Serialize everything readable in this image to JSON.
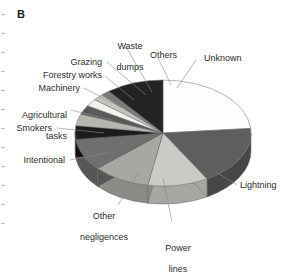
{
  "figure": {
    "panel_label": "B",
    "background": "#ffffff"
  },
  "chart_data": {
    "type": "pie",
    "title": "B",
    "subtitle": "",
    "xlabel": "",
    "ylabel": "",
    "style": "3d-pie",
    "legend_position": "none",
    "labels_position": "callout-leader-lines",
    "grid": false,
    "start_angle_deg": 0,
    "direction": "clockwise",
    "categories": [
      "Unknown",
      "Lightning",
      "Power lines",
      "Other negligences",
      "Intentional",
      "Smokers",
      "Agricultural tasks",
      "Machinery",
      "Forestry works",
      "Grazing",
      "Waste dumps",
      "Others"
    ],
    "values": [
      23.6,
      18.1,
      11.1,
      10.6,
      9.7,
      4.2,
      3.6,
      2.8,
      2.2,
      1.9,
      1.7,
      10.5
    ],
    "units": "percent",
    "slices": [
      {
        "label": "Unknown",
        "value": 23.6,
        "start_deg": 0.0,
        "end_deg": 85.0,
        "color": "#fdfdfb",
        "side_color": "#d9d9d4",
        "label_pos": "right-top"
      },
      {
        "label": "Lightning",
        "value": 18.1,
        "start_deg": 85.0,
        "end_deg": 150.0,
        "color": "#5e5e5e",
        "side_color": "#464646",
        "label_pos": "right-bottom"
      },
      {
        "label": "Power lines",
        "value": 11.1,
        "start_deg": 150.0,
        "end_deg": 190.0,
        "color": "#cbcbc6",
        "side_color": "#a7a7a2",
        "label_pos": "bottom-center"
      },
      {
        "label": "Other negligences",
        "value": 10.6,
        "start_deg": 190.0,
        "end_deg": 228.0,
        "color": "#a8a8a3",
        "side_color": "#8a8a86",
        "label_pos": "bottom-left"
      },
      {
        "label": "Intentional",
        "value": 9.7,
        "start_deg": 228.0,
        "end_deg": 263.0,
        "color": "#6f6f6f",
        "side_color": "#565656",
        "label_pos": "left"
      },
      {
        "label": "Smokers",
        "value": 4.2,
        "start_deg": 263.0,
        "end_deg": 278.0,
        "color": "#1c1c1c",
        "side_color": "#0f0f0f",
        "label_pos": "left"
      },
      {
        "label": "Agricultural tasks",
        "value": 3.6,
        "start_deg": 278.0,
        "end_deg": 291.0,
        "color": "#b6b6b1",
        "side_color": "#949490",
        "label_pos": "left"
      },
      {
        "label": "Machinery",
        "value": 2.8,
        "start_deg": 291.0,
        "end_deg": 301.0,
        "color": "#5a5a5a",
        "side_color": "#444444",
        "label_pos": "left"
      },
      {
        "label": "Forestry works",
        "value": 2.2,
        "start_deg": 301.0,
        "end_deg": 309.0,
        "color": "#f2f2ee",
        "side_color": "#cfcfca",
        "label_pos": "left"
      },
      {
        "label": "Grazing",
        "value": 1.9,
        "start_deg": 309.0,
        "end_deg": 316.0,
        "color": "#c4c4bf",
        "side_color": "#a0a09c",
        "label_pos": "top-left"
      },
      {
        "label": "Waste dumps",
        "value": 1.7,
        "start_deg": 316.0,
        "end_deg": 322.0,
        "color": "#7a7a7a",
        "side_color": "#5e5e5e",
        "label_pos": "top"
      },
      {
        "label": "Others",
        "value": 10.5,
        "start_deg": 322.0,
        "end_deg": 360.0,
        "color": "#232323",
        "side_color": "#141414",
        "label_pos": "top-right"
      }
    ]
  },
  "labels": {
    "unknown": "Unknown",
    "lightning": "Lightning",
    "power_lines_l1": "Power",
    "power_lines_l2": "lines",
    "other_negligences_l1": "Other",
    "other_negligences_l2": "negligences",
    "intentional": "Intentional",
    "smokers": "Smokers",
    "agricultural_l1": "Agricultural",
    "agricultural_l2": "tasks",
    "machinery": "Machinery",
    "forestry_works": "Forestry works",
    "grazing": "Grazing",
    "waste_dumps_l1": "Waste",
    "waste_dumps_l2": "dumps",
    "others": "Others"
  }
}
